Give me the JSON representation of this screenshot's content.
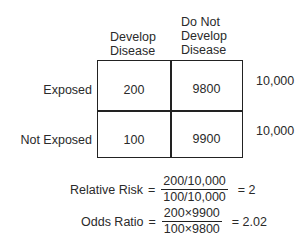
{
  "table": {
    "column_headers": [
      {
        "lines": [
          "Develop",
          "Disease"
        ]
      },
      {
        "lines": [
          "Do Not",
          "Develop",
          "Disease"
        ]
      }
    ],
    "rows": [
      {
        "label": "Exposed",
        "cells": [
          "200",
          "9800"
        ],
        "total": "10,000"
      },
      {
        "label": "Not Exposed",
        "cells": [
          "100",
          "9900"
        ],
        "total": "10,000"
      }
    ]
  },
  "formulas": {
    "relative_risk": {
      "label": "Relative Risk",
      "equals": "=",
      "numerator": "200/10,000",
      "denominator": "100/10,000",
      "result": "= 2"
    },
    "odds_ratio": {
      "label": "Odds Ratio",
      "equals": "=",
      "numerator": "200×9900",
      "denominator": "100×9800",
      "result": "= 2.02"
    }
  }
}
